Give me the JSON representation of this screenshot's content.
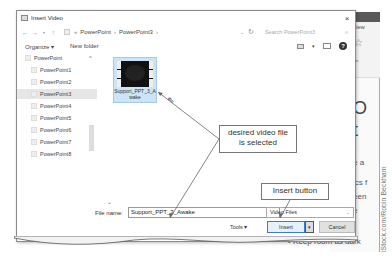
{
  "dialog": {
    "title": "Insert Video",
    "close_label": "×",
    "address": {
      "breadcrumbs": [
        "PowerPoint",
        "PowerPoint3"
      ],
      "separator": "›",
      "prefix": "«"
    },
    "search_placeholder": "Search PowerPoint3",
    "toolbar": {
      "organize_label": "Organize ▾",
      "new_folder_label": "New folder",
      "help_label": "?"
    },
    "nav": {
      "items": [
        {
          "label": "PowerPoint",
          "selected": false
        },
        {
          "label": "PowerPoint1",
          "selected": false
        },
        {
          "label": "PowerPoint2",
          "selected": false
        },
        {
          "label": "PowerPoint3",
          "selected": true
        },
        {
          "label": "PowerPoint4",
          "selected": false
        },
        {
          "label": "PowerPoint5",
          "selected": false
        },
        {
          "label": "PowerPoint6",
          "selected": false
        },
        {
          "label": "PowerPoint7",
          "selected": false
        },
        {
          "label": "PowerPoint8",
          "selected": false
        }
      ]
    },
    "files": [
      {
        "name_line1": "Support_PPT_3_A",
        "name_line2": "wake",
        "selected": true
      }
    ],
    "bottom": {
      "file_name_label": "File name:",
      "file_name_value": "Support_PPT_3_Awake",
      "file_type": "Video Files",
      "tools_label": "Tools ▾",
      "insert_label": "Insert",
      "cancel_label": "Cancel"
    }
  },
  "callouts": {
    "selected_file": "desired video file is selected",
    "insert_button": "Insert button"
  },
  "background_app": {
    "tab": "View",
    "ribbon_label": "ype",
    "slide_text_1": "O",
    "slide_text_2": "t",
    "bullets": [
      "e a",
      "ics f",
      "een",
      "e",
      "Keep room as dark"
    ]
  },
  "credit": "iStock.com/Robin Beckham"
}
